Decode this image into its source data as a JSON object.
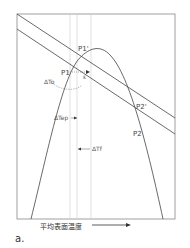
{
  "figure": {
    "panel_label": "a.",
    "xaxis_label": "平均表面温度",
    "points": {
      "p1_prime": "P1'",
      "p1": "P1",
      "p2_prime": "P2'",
      "p2": "P2"
    },
    "annotations": {
      "delta_to": "ΔTo",
      "delta_tep": "ΔTep",
      "delta_tf": "ΔTf",
      "epsilon": "ε"
    }
  }
}
